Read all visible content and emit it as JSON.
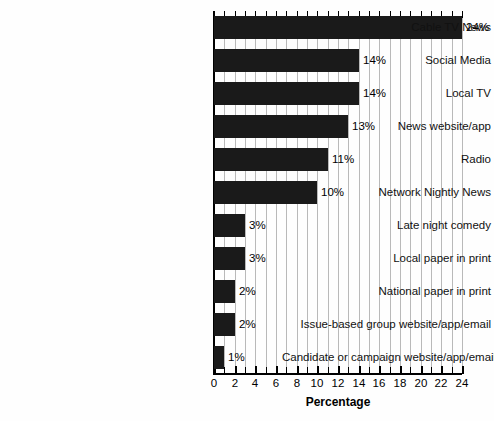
{
  "chart_data": {
    "type": "bar",
    "orientation": "horizontal",
    "title": "",
    "xlabel": "Percentage",
    "ylabel": "",
    "xlim": [
      0,
      24
    ],
    "xticks": [
      0,
      2,
      4,
      6,
      8,
      10,
      12,
      14,
      16,
      18,
      20,
      22,
      24
    ],
    "minor_tick_step": 1,
    "grid": "vertical minor gridlines at every 1 unit",
    "legend": "none",
    "bar_color": "#1a1a1a",
    "categories": [
      "Cable TV News",
      "Social Media",
      "Local TV",
      "News website/app",
      "Radio",
      "Network Nightly News",
      "Late night comedy",
      "Local paper in print",
      "National paper in print",
      "Issue-based group website/app/email",
      "Candidate or campaign website/app/email"
    ],
    "values": [
      24,
      14,
      14,
      13,
      11,
      10,
      3,
      3,
      2,
      2,
      1
    ],
    "value_labels": [
      "24%",
      "14%",
      "14%",
      "13%",
      "11%",
      "10%",
      "3%",
      "3%",
      "2%",
      "2%",
      "1%"
    ]
  },
  "axis": {
    "xlabel_text": "Percentage",
    "tick_labels": [
      "0",
      "2",
      "4",
      "6",
      "8",
      "10",
      "12",
      "14",
      "16",
      "18",
      "20",
      "22",
      "24"
    ]
  }
}
